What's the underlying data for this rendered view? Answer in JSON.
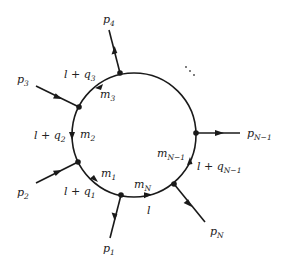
{
  "diagram": {
    "loop": {
      "cx": 134,
      "cy": 135,
      "r": 62
    },
    "external_legs": [
      {
        "id": "p4",
        "label": "p",
        "sub": "4",
        "label_pos": [
          108,
          22
        ]
      },
      {
        "id": "p3",
        "label": "p",
        "sub": "3",
        "label_pos": [
          17,
          82
        ]
      },
      {
        "id": "p2",
        "label": "p",
        "sub": "2",
        "label_pos": [
          17,
          196
        ]
      },
      {
        "id": "p1",
        "label": "p",
        "sub": "1",
        "label_pos": [
          104,
          252
        ]
      },
      {
        "id": "pN",
        "label": "p",
        "sub": "N",
        "label_pos": [
          209,
          236
        ]
      },
      {
        "id": "pN-1",
        "label": "p",
        "sub": "N−1",
        "label_pos": [
          247,
          137
        ]
      }
    ],
    "propagator_momenta": [
      {
        "id": "l+q3",
        "main": "l + q",
        "sub": "3",
        "pos": [
          64,
          78
        ]
      },
      {
        "id": "l+q2",
        "main": "l + q",
        "sub": "2",
        "pos": [
          34,
          139
        ]
      },
      {
        "id": "l+q1",
        "main": "l + q",
        "sub": "1",
        "pos": [
          64,
          195
        ]
      },
      {
        "id": "l",
        "main": "l",
        "sub": "",
        "pos": [
          147,
          214
        ]
      },
      {
        "id": "l+qN-1",
        "main": "l + q",
        "sub": "N−1",
        "pos": [
          197,
          170
        ]
      }
    ],
    "masses": [
      {
        "id": "m3",
        "main": "m",
        "sub": "3",
        "pos": [
          100,
          98
        ]
      },
      {
        "id": "m2",
        "main": "m",
        "sub": "2",
        "pos": [
          80,
          138
        ]
      },
      {
        "id": "m1",
        "main": "m",
        "sub": "1",
        "pos": [
          101,
          177
        ]
      },
      {
        "id": "mN",
        "main": "m",
        "sub": "N",
        "pos": [
          136,
          189
        ]
      },
      {
        "id": "mN-1",
        "main": "m",
        "sub": "N−1",
        "pos": [
          158,
          157
        ]
      }
    ],
    "ellipsis": "⋱"
  }
}
